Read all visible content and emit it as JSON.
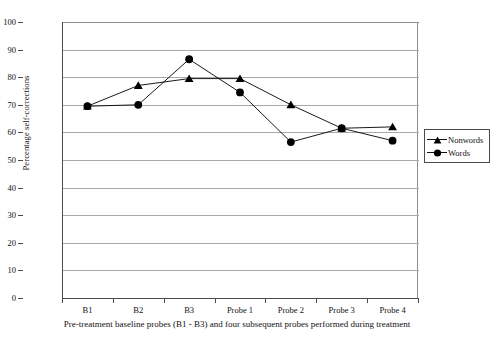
{
  "chart_data": {
    "type": "line",
    "title": "",
    "xlabel": "Pre-treatment baseline probes (B1 - B3) and four subsequent probes performed during treatment",
    "ylabel": "Percentage self-corrections",
    "categories": [
      "B1",
      "B2",
      "B3",
      "Probe 1",
      "Probe 2",
      "Probe 3",
      "Probe 4"
    ],
    "ylim": [
      0,
      100
    ],
    "ytick_step": 10,
    "yticks": [
      100,
      90,
      80,
      70,
      60,
      50,
      40,
      30,
      20,
      10,
      0
    ],
    "grid": true,
    "legend_position": "right",
    "series": [
      {
        "name": "Nonwords",
        "marker": "triangle",
        "color": "#000000",
        "values": [
          69.5,
          77.0,
          79.5,
          79.5,
          70.0,
          61.5,
          62.0
        ]
      },
      {
        "name": "Words",
        "marker": "circle",
        "color": "#000000",
        "values": [
          69.5,
          70.0,
          86.5,
          74.5,
          56.5,
          61.5,
          57.0
        ]
      }
    ]
  },
  "axes": {
    "y_title": "Percentage self-corrections",
    "x_caption": "Pre-treatment baseline probes (B1 - B3) and four subsequent probes performed during treatment"
  },
  "legend": {
    "items": [
      {
        "label": "Nonwords",
        "symbol": "triangle-marker-icon"
      },
      {
        "label": "Words",
        "symbol": "circle-marker-icon"
      }
    ]
  }
}
